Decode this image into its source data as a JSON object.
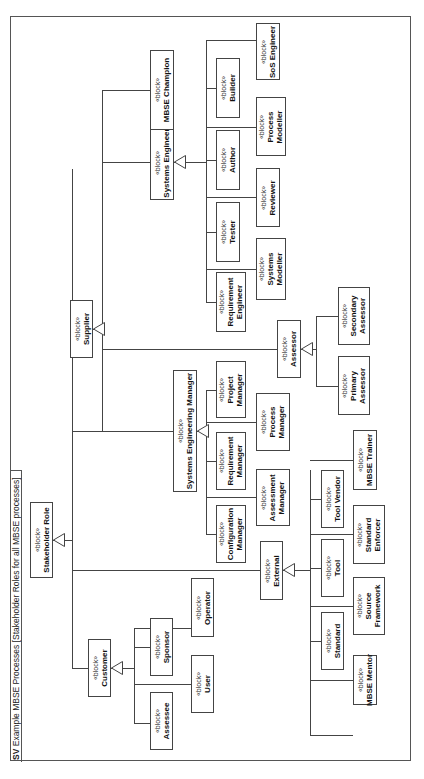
{
  "frame": {
    "kind": "SV",
    "title": "Example MBSE Processes [Stakeholder Roles for all MBSE processes]"
  },
  "stereotype": "«block»",
  "blocks": {
    "stakeholder_role": [
      "Stakeholder Role"
    ],
    "customer": [
      "Customer"
    ],
    "assessee": [
      "Assessee"
    ],
    "sponsor": [
      "Sponsor"
    ],
    "user": [
      "User"
    ],
    "operator": [
      "Operator"
    ],
    "external": [
      "External"
    ],
    "standard": [
      "Standard"
    ],
    "tool": [
      "Tool"
    ],
    "tool_vendor": [
      "Tool Vendor"
    ],
    "mbse_mentor": [
      "MBSE Mentor"
    ],
    "source_framework": [
      "Source",
      "Framework"
    ],
    "standard_enforcer": [
      "Standard",
      "Enforcer"
    ],
    "mbse_trainer": [
      "MBSE Trainer"
    ],
    "systems_engineering_manager": [
      "Systems Engineering Manager"
    ],
    "configuration_manager": [
      "Configuration",
      "Manager"
    ],
    "requirement_manager": [
      "Requirement",
      "Manager"
    ],
    "project_manager": [
      "Project",
      "Manager"
    ],
    "assessment_manager": [
      "Assessment",
      "Manager"
    ],
    "process_manager": [
      "Process",
      "Manager"
    ],
    "supplier": [
      "Supplier"
    ],
    "assessor": [
      "Assessor"
    ],
    "primary_assessor": [
      "Primary",
      "Assessor"
    ],
    "secondary_assessor": [
      "Secondary",
      "Assessor"
    ],
    "systems_engineer": [
      "Systems Engineer"
    ],
    "requirement_engineer": [
      "Requirement",
      "Engineer"
    ],
    "tester": [
      "Tester"
    ],
    "author": [
      "Author"
    ],
    "builder": [
      "Builder"
    ],
    "systems_modeller": [
      "Systems",
      "Modeller"
    ],
    "reviewer": [
      "Reviewer"
    ],
    "process_modeller": [
      "Process",
      "Modeller"
    ],
    "sos_engineer": [
      "SoS Engineer"
    ],
    "mbse_champion": [
      "MBSE Champion"
    ]
  },
  "generalizations": [
    {
      "parent": "Stakeholder Role",
      "children": [
        "Customer",
        "External",
        "Systems Engineering Manager",
        "Supplier"
      ]
    },
    {
      "parent": "Customer",
      "children": [
        "Assessee",
        "Sponsor",
        "User",
        "Operator"
      ]
    },
    {
      "parent": "External",
      "children": [
        "Standard",
        "Tool",
        "Tool Vendor",
        "MBSE Mentor",
        "Source Framework",
        "Standard Enforcer",
        "MBSE Trainer"
      ]
    },
    {
      "parent": "Systems Engineering Manager",
      "children": [
        "Configuration Manager",
        "Requirement Manager",
        "Project Manager",
        "Assessment Manager",
        "Process Manager"
      ]
    },
    {
      "parent": "Supplier",
      "children": [
        "Systems Engineering Manager",
        "Assessor",
        "Systems Engineer",
        "MBSE Champion"
      ]
    },
    {
      "parent": "Assessor",
      "children": [
        "Primary Assessor",
        "Secondary Assessor"
      ]
    },
    {
      "parent": "Systems Engineer",
      "children": [
        "Requirement Engineer",
        "Tester",
        "Author",
        "Builder",
        "Systems Modeller",
        "Reviewer",
        "Process Modeller",
        "SoS Engineer"
      ]
    }
  ]
}
